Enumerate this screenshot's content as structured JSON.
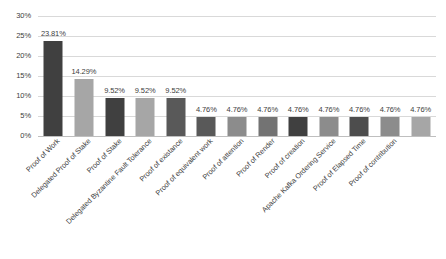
{
  "chart_data": {
    "type": "bar",
    "title": "",
    "subtitle": "",
    "xlabel": "",
    "ylabel": "",
    "ylim": [
      0,
      30
    ],
    "y_tick_labels": [
      "0%",
      "5%",
      "10%",
      "15%",
      "20%",
      "25%",
      "30%"
    ],
    "y_tick_values": [
      0,
      5,
      10,
      15,
      20,
      25,
      30
    ],
    "grid": true,
    "legend": "none",
    "categories": [
      "Proof of Work",
      "Delegated Proof of Stake",
      "Proof of Stake",
      "Delegated Byzantine Fault Tolerance",
      "Proof of existance",
      "Proof of equivalent work",
      "Proof of attention",
      "Proof of Render",
      "Proof of creation",
      "Apache Kafka Ordering Service",
      "Proof of Elapsed Time",
      "Proof of contribution"
    ],
    "values": [
      23.81,
      14.29,
      9.52,
      9.52,
      9.52,
      4.76,
      4.76,
      4.76,
      4.76,
      4.76,
      4.76,
      4.76
    ],
    "bar_count": 13,
    "bar_values": [
      23.81,
      14.29,
      9.52,
      9.52,
      9.52,
      4.76,
      4.76,
      4.76,
      4.76,
      4.76,
      4.76,
      4.76,
      4.76
    ],
    "data_labels": [
      "23.81%",
      "14.29%",
      "9.52%",
      "9.52%",
      "9.52%",
      "4.76%",
      "4.76%",
      "4.76%",
      "4.76%",
      "4.76%",
      "4.76%",
      "4.76%",
      "4.76%"
    ],
    "bar_colors": [
      "#404040",
      "#a6a6a6",
      "#404040",
      "#a6a6a6",
      "#595959",
      "#595959",
      "#8c8c8c",
      "#737373",
      "#404040",
      "#8c8c8c",
      "#4d4d4d",
      "#8c8c8c",
      "#a6a6a6"
    ],
    "gridline_color": "#d9d9d9",
    "axis_color": "#bfbfbf",
    "text_color": "#404040",
    "background_color": "#ffffff"
  }
}
